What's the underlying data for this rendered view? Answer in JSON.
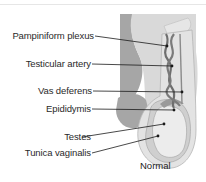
{
  "diagram": {
    "caption": "Normal",
    "labels": [
      {
        "id": "pampiniform-plexus",
        "text": "Pampiniform plexus"
      },
      {
        "id": "testicular-artery",
        "text": "Testicular artery"
      },
      {
        "id": "vas-deferens",
        "text": "Vas deferens"
      },
      {
        "id": "epididymis",
        "text": "Epididymis"
      },
      {
        "id": "testes",
        "text": "Testes"
      },
      {
        "id": "tunica-vaginalis",
        "text": "Tunica vaginalis"
      }
    ],
    "colors": {
      "outer_tissue": "#d9d9d9",
      "dark_tissue": "#a6a6a6",
      "mid_tissue": "#bfbfbf",
      "light_fill": "#ececec",
      "vessel": "#6e6e6e",
      "leader_line": "#1a1a1a"
    }
  }
}
